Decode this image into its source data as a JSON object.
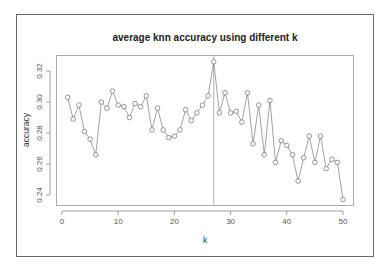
{
  "chart_data": {
    "type": "line",
    "title": "average knn accuracy using different k",
    "xlabel": "k",
    "ylabel": "accuracy",
    "xlim": [
      0,
      50
    ],
    "ylim": [
      0.235,
      0.328
    ],
    "x_ticks": [
      0,
      10,
      20,
      30,
      40,
      50
    ],
    "x_tick_labels": [
      "0",
      "10",
      "20",
      "30",
      "40",
      "50"
    ],
    "y_ticks": [
      0.24,
      0.26,
      0.28,
      0.3,
      0.32
    ],
    "y_tick_labels": [
      "0.24",
      "0.26",
      "0.28",
      "0.30",
      "0.32"
    ],
    "grid": false,
    "legend": null,
    "marker": "open-circle",
    "annotations": [
      {
        "type": "vertical-line",
        "x": 27
      }
    ],
    "series": [
      {
        "name": "accuracy",
        "x": [
          1,
          2,
          3,
          4,
          5,
          6,
          7,
          8,
          9,
          10,
          11,
          12,
          13,
          14,
          15,
          16,
          17,
          18,
          19,
          20,
          21,
          22,
          23,
          24,
          25,
          26,
          27,
          28,
          29,
          30,
          31,
          32,
          33,
          34,
          35,
          36,
          37,
          38,
          39,
          40,
          41,
          42,
          43,
          44,
          45,
          46,
          47,
          48,
          49,
          50
        ],
        "values": [
          0.303,
          0.289,
          0.298,
          0.281,
          0.276,
          0.266,
          0.3,
          0.296,
          0.307,
          0.298,
          0.297,
          0.29,
          0.299,
          0.297,
          0.304,
          0.282,
          0.296,
          0.282,
          0.277,
          0.278,
          0.282,
          0.295,
          0.288,
          0.293,
          0.298,
          0.304,
          0.326,
          0.293,
          0.306,
          0.293,
          0.294,
          0.287,
          0.306,
          0.273,
          0.298,
          0.266,
          0.301,
          0.261,
          0.275,
          0.272,
          0.266,
          0.249,
          0.264,
          0.278,
          0.261,
          0.278,
          0.257,
          0.263,
          0.261,
          0.237
        ]
      }
    ]
  }
}
